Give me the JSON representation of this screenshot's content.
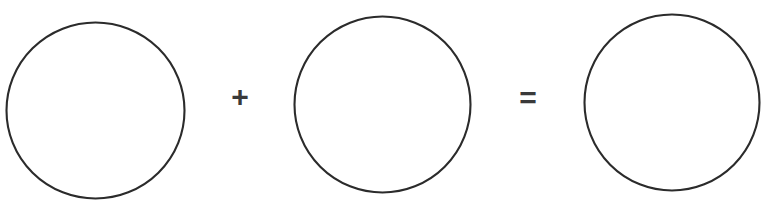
{
  "canvas": {
    "width": 769,
    "height": 202,
    "background_color": "#ffffff",
    "stroke_color": "#2b2b2b",
    "symbol_color": "#3a3a3a"
  },
  "equation": {
    "description": "circle plus circle equals circle",
    "operators": [
      {
        "name": "plus",
        "glyph": "+"
      },
      {
        "name": "equals",
        "glyph": "="
      }
    ]
  },
  "shapes": [
    {
      "name": "circle-one",
      "glyph": "circle",
      "cx": 95.5,
      "cy": 110.5,
      "rx": 89,
      "ry": 88,
      "stroke_width": 2.1,
      "fill": "none",
      "stroke": "#2b2b2b"
    },
    {
      "name": "circle-two",
      "glyph": "circle",
      "cx": 382.5,
      "cy": 104.5,
      "rx": 88,
      "ry": 88,
      "stroke_width": 2.1,
      "fill": "none",
      "stroke": "#2b2b2b"
    },
    {
      "name": "circle-three",
      "glyph": "circle",
      "cx": 672,
      "cy": 102.5,
      "rx": 87.5,
      "ry": 88,
      "stroke_width": 2.1,
      "fill": "none",
      "stroke": "#2b2b2b"
    }
  ],
  "chart_data": {
    "type": "diagram",
    "title": "",
    "items": [
      "circle",
      "+",
      "circle",
      "=",
      "circle"
    ]
  }
}
